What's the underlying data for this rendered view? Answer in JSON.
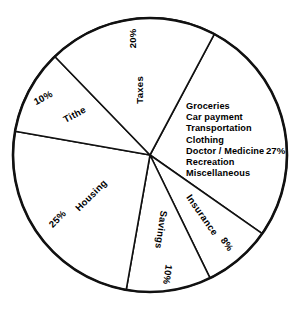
{
  "chart_data": {
    "type": "pie",
    "title": "",
    "subtitle": "",
    "xlabel": "",
    "ylabel": "",
    "grid": false,
    "legend_position": "none",
    "units": "percent",
    "total": 100,
    "categories": [
      "Groceries / Car payment / Transportation / Clothing / Doctor / Medicine / Recreation / Miscellaneous",
      "Insurance",
      "Savings",
      "Housing",
      "Tithe",
      "Taxes"
    ],
    "values": [
      27,
      8,
      10,
      25,
      10,
      20
    ],
    "slices": [
      {
        "id": "living-expenses",
        "label": "",
        "percent_label": "27%",
        "value": 27,
        "start_angle_deg": -62,
        "end_angle_deg": 35,
        "label_rotation_deg": 0,
        "label_radius": 0.62,
        "sublist": [
          "Groceries",
          "Car  payment",
          "Transportation",
          "Clothing",
          "Doctor / Medicine",
          "Recreation",
          "Miscellaneous"
        ]
      },
      {
        "id": "insurance",
        "label": "Insurance",
        "percent_label": "8%",
        "value": 8,
        "start_angle_deg": 35,
        "end_angle_deg": 64,
        "label_rotation_deg": 55,
        "label_radius": 0.58,
        "pct_rotation_deg": 55,
        "pct_radius": 0.86
      },
      {
        "id": "savings",
        "label": "Savings",
        "percent_label": "10%",
        "value": 10,
        "start_angle_deg": 64,
        "end_angle_deg": 100,
        "label_rotation_deg": 98,
        "label_radius": 0.55,
        "pct_rotation_deg": 98,
        "pct_radius": 0.88
      },
      {
        "id": "housing",
        "label": "Housing",
        "percent_label": "25%",
        "value": 25,
        "start_angle_deg": 100,
        "end_angle_deg": 190,
        "label_rotation_deg": -45,
        "label_radius": 0.52,
        "pct_rotation_deg": -45,
        "pct_radius": 0.82
      },
      {
        "id": "tithe",
        "label": "Tithe",
        "percent_label": "10%",
        "value": 10,
        "start_angle_deg": 190,
        "end_angle_deg": 226,
        "label_rotation_deg": -28,
        "label_radius": 0.62,
        "pct_rotation_deg": -28,
        "pct_radius": 0.88
      },
      {
        "id": "taxes",
        "label": "Taxes",
        "percent_label": "20%",
        "value": 20,
        "start_angle_deg": 226,
        "end_angle_deg": 298,
        "label_rotation_deg": -90,
        "label_radius": 0.48,
        "pct_rotation_deg": -90,
        "pct_radius": 0.86
      }
    ],
    "geometry": {
      "center_x": 150,
      "center_y": 155,
      "radius": 137
    },
    "colors": {
      "background": "#ffffff",
      "slice_fill": "#ffffff",
      "outline": "#111111",
      "text": "#000000"
    }
  },
  "expense_list": {
    "lines": [
      "Groceries",
      "Car  payment",
      "Transportation",
      "Clothing",
      "Doctor / Medicine",
      "Recreation",
      "Miscellaneous"
    ],
    "percent": "27%"
  }
}
